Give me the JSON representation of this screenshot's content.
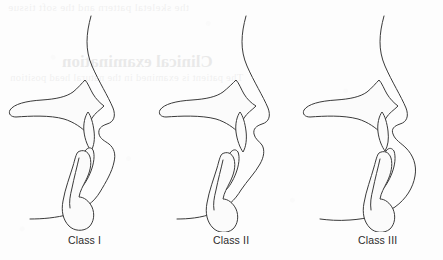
{
  "figure": {
    "panels": [
      {
        "id": "class-i",
        "caption": "Class I",
        "description": "Sagittal skeletal profile with normal maxillo-mandibular relationship; straight facial profile, chin aligned beneath the upper jaw."
      },
      {
        "id": "class-ii",
        "caption": "Class II",
        "description": "Sagittal skeletal profile with retruded mandible; convex facial profile, chin positioned posteriorly."
      },
      {
        "id": "class-iii",
        "caption": "Class III",
        "description": "Sagittal skeletal profile with protruded mandible; concave facial profile, chin positioned anteriorly."
      }
    ]
  },
  "bleed_through": {
    "note": "Faint mirrored show-through text from the reverse side of the scanned page",
    "top_line": "the skeletal pattern and the soft tissue",
    "heading": "Clinical examination",
    "sub_line": "The patient is examined in the natural head position"
  },
  "colors": {
    "page_background": "#fdfdfd",
    "line_stroke": "#3a3a3a",
    "bone_fill": "#fbfbfb",
    "stipple": "#8d8d8d",
    "caption_text": "#2b2b2b"
  }
}
